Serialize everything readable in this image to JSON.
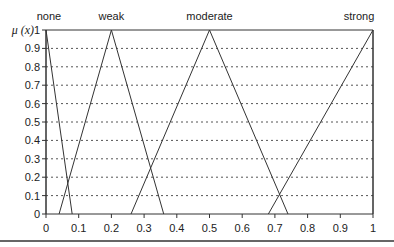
{
  "chart_data": {
    "type": "line",
    "title": "",
    "xlabel": "",
    "ylabel": "μ(x)",
    "xlim": [
      0,
      1
    ],
    "ylim": [
      0,
      1
    ],
    "grid": "horizontal dotted",
    "x_ticks": [
      "0",
      "0.1",
      "0.2",
      "0.3",
      "0.4",
      "0.5",
      "0.6",
      "0.7",
      "0.8",
      "0.9",
      "1"
    ],
    "y_ticks": [
      "0",
      "0.1",
      "0.2",
      "0.3",
      "0.4",
      "0.5",
      "0.6",
      "0.7",
      "0.8",
      "0.9",
      "1"
    ],
    "series": [
      {
        "name": "none",
        "x": [
          0,
          0,
          0.08
        ],
        "y": [
          0,
          1,
          0
        ]
      },
      {
        "name": "weak",
        "x": [
          0.04,
          0.2,
          0.36
        ],
        "y": [
          0,
          1,
          0
        ]
      },
      {
        "name": "moderate",
        "x": [
          0.26,
          0.5,
          0.74
        ],
        "y": [
          0,
          1,
          0
        ]
      },
      {
        "name": "strong",
        "x": [
          0.68,
          1.0,
          1.0
        ],
        "y": [
          0,
          1,
          0
        ]
      }
    ]
  },
  "labels": {
    "ylabel": "μ (x)",
    "none": "none",
    "weak": "weak",
    "moderate": "moderate",
    "strong": "strong"
  }
}
